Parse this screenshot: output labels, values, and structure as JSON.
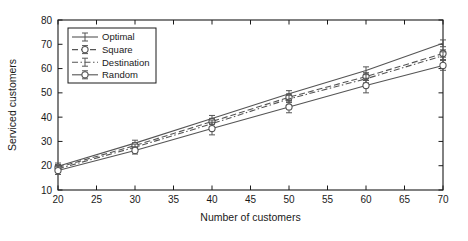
{
  "chart_data": {
    "type": "line",
    "title": "",
    "xlabel": "Number of customers",
    "ylabel": "Serviced customers",
    "x": [
      20,
      30,
      40,
      50,
      60,
      70
    ],
    "xlim": [
      20,
      70
    ],
    "ylim": [
      10,
      80
    ],
    "xticks": [
      20,
      25,
      30,
      35,
      40,
      45,
      50,
      55,
      60,
      65,
      70
    ],
    "yticks": [
      10,
      20,
      30,
      40,
      50,
      60,
      70,
      80
    ],
    "xtick_labels": [
      "20",
      "25",
      "30",
      "35",
      "40",
      "45",
      "50",
      "55",
      "60",
      "65",
      "70"
    ],
    "ytick_labels": [
      "10",
      "20",
      "30",
      "40",
      "50",
      "60",
      "70",
      "80"
    ],
    "grid": false,
    "legend_position": "upper-left",
    "error_bars": true,
    "series": [
      {
        "name": "Optimal",
        "values": [
          19.8,
          29.3,
          39.4,
          49.6,
          59.2,
          70.4
        ],
        "errors": [
          1.3,
          1.2,
          1.3,
          1.3,
          1.5,
          1.4
        ],
        "line_style": "solid",
        "marker": "none"
      },
      {
        "name": "Square",
        "values": [
          19.3,
          28.3,
          38.2,
          48.2,
          56.7,
          66.2
        ],
        "errors": [
          1.2,
          1.2,
          1.3,
          1.4,
          1.6,
          1.5
        ],
        "line_style": "dashed",
        "marker": "circle"
      },
      {
        "name": "Destination",
        "values": [
          18.7,
          27.6,
          37.3,
          47.5,
          55.8,
          65.3
        ],
        "errors": [
          1.4,
          1.3,
          1.5,
          1.5,
          1.7,
          1.6
        ],
        "line_style": "dash-dot",
        "marker": "none"
      },
      {
        "name": "Random",
        "values": [
          18.0,
          26.3,
          35.3,
          44.2,
          53.0,
          61.3
        ],
        "errors": [
          1.6,
          1.5,
          2.6,
          2.4,
          3.0,
          2.0
        ],
        "line_style": "solid",
        "marker": "circle"
      }
    ]
  },
  "axes": {
    "x_title": "Number of customers",
    "y_title": "Serviced customers"
  },
  "legend": {
    "items": [
      {
        "label": "Optimal"
      },
      {
        "label": "Square"
      },
      {
        "label": "Destination"
      },
      {
        "label": "Random"
      }
    ]
  },
  "colors": {
    "axis": "#1a1a1a",
    "series_line": "#555555",
    "background": "#ffffff"
  }
}
